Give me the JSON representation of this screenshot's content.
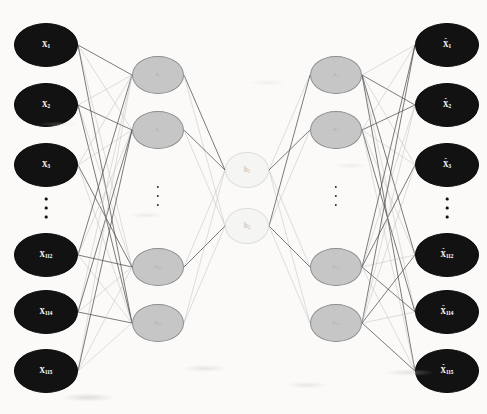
{
  "figure": {
    "background_color": "#fbfaf8",
    "node_colors": {
      "input_output": "#121212",
      "hidden": "#c6c6c6",
      "hidden_border": "#8d8d8d",
      "code": "#f5f5f3",
      "code_border": "#dedede",
      "edge_dark": "#4a4a4a",
      "edge_light": "#b9b9b9"
    }
  },
  "layers": [
    {
      "name": "input-layer",
      "role": "input",
      "style": "io",
      "center_x": 46,
      "rx": 32,
      "ry": 22,
      "label_prefix": "X",
      "hat": false,
      "ellipsis_y": 208,
      "nodes": [
        {
          "id": "x1",
          "base": "X",
          "sub": "1",
          "y": 45,
          "label": "X1"
        },
        {
          "id": "x2",
          "base": "X",
          "sub": "2",
          "y": 105,
          "label": "X2"
        },
        {
          "id": "x3",
          "base": "X",
          "sub": "3",
          "y": 165,
          "label": "X3"
        },
        {
          "id": "x112",
          "base": "X",
          "sub": "112",
          "y": 255,
          "label": "X112"
        },
        {
          "id": "x114",
          "base": "X",
          "sub": "114",
          "y": 312,
          "label": "X114"
        },
        {
          "id": "x115",
          "base": "X",
          "sub": "115",
          "y": 371,
          "label": "X115"
        }
      ]
    },
    {
      "name": "encoder-hidden-layer",
      "role": "hidden",
      "style": "hid",
      "center_x": 158,
      "rx": 26,
      "ry": 19,
      "label_prefix": "a",
      "hat": false,
      "ellipsis_y": 196,
      "nodes": [
        {
          "id": "a1",
          "base": "a",
          "sub": "1",
          "y": 75,
          "label": "a1"
        },
        {
          "id": "a2",
          "base": "a",
          "sub": "2",
          "y": 130,
          "label": "a2"
        },
        {
          "id": "a63",
          "base": "a",
          "sub": "63",
          "y": 267,
          "label": "a63"
        },
        {
          "id": "a64",
          "base": "a",
          "sub": "64",
          "y": 323,
          "label": "a64"
        }
      ]
    },
    {
      "name": "code-layer",
      "role": "bottleneck",
      "style": "code",
      "center_x": 247,
      "rx": 22,
      "ry": 18,
      "label_prefix": "h",
      "hat": false,
      "ellipsis_y": null,
      "nodes": [
        {
          "id": "h1",
          "base": "h",
          "sub": "1",
          "y": 170,
          "label": "h1"
        },
        {
          "id": "h2",
          "base": "h",
          "sub": "2",
          "y": 226,
          "label": "h2"
        }
      ]
    },
    {
      "name": "decoder-hidden-layer",
      "role": "hidden",
      "style": "hid",
      "center_x": 336,
      "rx": 26,
      "ry": 19,
      "label_prefix": "a",
      "hat": false,
      "ellipsis_y": 196,
      "nodes": [
        {
          "id": "d1",
          "base": "a",
          "sub": "1",
          "y": 75,
          "label": "a1"
        },
        {
          "id": "d2",
          "base": "a",
          "sub": "2",
          "y": 130,
          "label": "a2"
        },
        {
          "id": "d63",
          "base": "a",
          "sub": "63",
          "y": 267,
          "label": "a63"
        },
        {
          "id": "d64",
          "base": "a",
          "sub": "64",
          "y": 323,
          "label": "a64"
        }
      ]
    },
    {
      "name": "output-layer",
      "role": "output",
      "style": "io",
      "center_x": 447,
      "rx": 32,
      "ry": 22,
      "label_prefix": "X",
      "hat": true,
      "ellipsis_y": 208,
      "nodes": [
        {
          "id": "o1",
          "base": "X",
          "sub": "1",
          "y": 45,
          "label": "X̂1"
        },
        {
          "id": "o2",
          "base": "X",
          "sub": "2",
          "y": 105,
          "label": "X̂2"
        },
        {
          "id": "o3",
          "base": "X",
          "sub": "3",
          "y": 165,
          "label": "X̂3"
        },
        {
          "id": "o112",
          "base": "X",
          "sub": "112",
          "y": 255,
          "label": "X̂112"
        },
        {
          "id": "o114",
          "base": "X",
          "sub": "114",
          "y": 312,
          "label": "X̂114"
        },
        {
          "id": "o115",
          "base": "X",
          "sub": "115",
          "y": 371,
          "label": "X̂115"
        }
      ]
    }
  ],
  "edge_groups": [
    {
      "name": "input-to-encoder",
      "from": "input-layer",
      "to": "encoder-hidden-layer",
      "from_x": 78,
      "to_x": 132
    },
    {
      "name": "encoder-to-code",
      "from": "encoder-hidden-layer",
      "to": "code-layer",
      "from_x": 184,
      "to_x": 225
    },
    {
      "name": "code-to-decoder",
      "from": "code-layer",
      "to": "decoder-hidden-layer",
      "from_x": 269,
      "to_x": 310
    },
    {
      "name": "decoder-to-output",
      "from": "decoder-hidden-layer",
      "to": "output-layer",
      "from_x": 362,
      "to_x": 415
    }
  ],
  "ellipsis": {
    "dot_count": 3,
    "columns": [
      {
        "name": "input-ellipsis",
        "x": 46,
        "y": 208,
        "faint": false
      },
      {
        "name": "encoder-hidden-ellipsis",
        "x": 158,
        "y": 196,
        "faint": true
      },
      {
        "name": "decoder-hidden-ellipsis",
        "x": 336,
        "y": 196,
        "faint": true
      },
      {
        "name": "output-ellipsis",
        "x": 447,
        "y": 208,
        "faint": false
      }
    ]
  }
}
